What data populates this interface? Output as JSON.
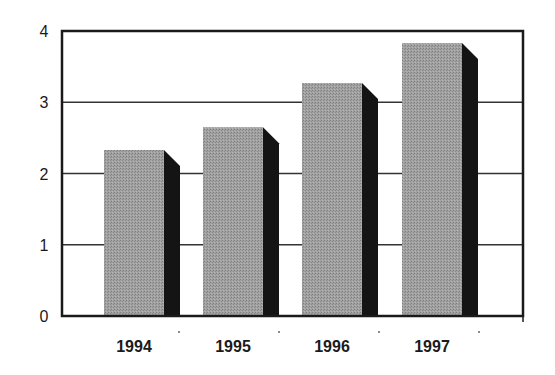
{
  "chart_data": {
    "type": "bar",
    "title": "",
    "xlabel": "",
    "ylabel": "",
    "categories": [
      "1994",
      "1995",
      "1996",
      "1997"
    ],
    "values": [
      2.33,
      2.65,
      3.27,
      3.83
    ],
    "ylim": [
      0,
      4
    ],
    "yticks": [
      0,
      1,
      2,
      3,
      4
    ],
    "grid": true,
    "legend": null,
    "style": "3d-shaded-bars"
  },
  "colors": {
    "bar_face": "#9c9c9c",
    "bar_side": "#141414",
    "frame": "#1a1a1a",
    "grid": "#333333"
  }
}
